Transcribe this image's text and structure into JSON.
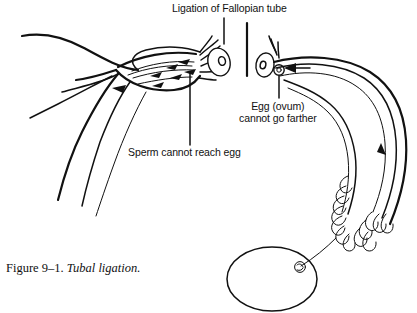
{
  "figure": {
    "caption_number": "Figure 9–1.",
    "caption_title": "Tubal ligation.",
    "title_label": "Ligation of Fallopian tube",
    "ink_color": "#111111",
    "background_color": "#ffffff"
  },
  "annotations": {
    "ligation": {
      "text": "Ligation of Fallopian tube"
    },
    "egg": {
      "line1": "Egg (ovum)",
      "line2": "cannot go farther"
    },
    "sperm": {
      "text": "Sperm cannot reach egg"
    }
  },
  "diagram": {
    "type": "anatomical-line-drawing",
    "parts": [
      "left-fallopian-tube",
      "left-ovary",
      "ligation-gap",
      "right-ovary",
      "right-fallopian-tube",
      "fimbriae",
      "uterus",
      "sperm-arrows",
      "egg-arrow"
    ],
    "sperm_arrow_count": 6,
    "egg_arrow_count": 2
  }
}
